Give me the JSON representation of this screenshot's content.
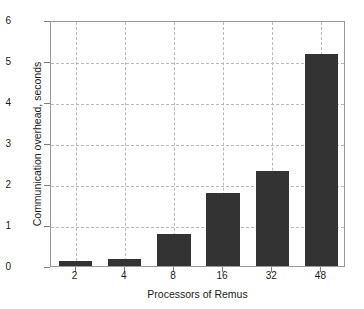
{
  "chart_data": {
    "type": "bar",
    "title": "",
    "xlabel": "Processors of Remus",
    "ylabel": "Communication overhead, seconds",
    "categories": [
      "2",
      "4",
      "8",
      "16",
      "32",
      "48"
    ],
    "values": [
      0.12,
      0.18,
      0.78,
      1.77,
      2.31,
      5.18
    ],
    "series": [
      {
        "name": "Communication overhead",
        "values": [
          0.12,
          0.18,
          0.78,
          1.77,
          2.31,
          5.18
        ]
      }
    ],
    "ylim": [
      0,
      6
    ],
    "yticks": [
      0,
      1,
      2,
      3,
      4,
      5,
      6
    ],
    "ytick_labels": [
      "0",
      "1",
      "2",
      "3",
      "4",
      "5",
      "6"
    ],
    "xtick_labels": [
      "2",
      "4",
      "8",
      "16",
      "32",
      "48"
    ],
    "grid": true,
    "grid_style": "dashed",
    "legend": null,
    "bar_color": "#333333",
    "grid_color": "#b9b9b9",
    "axis_color": "#9a9a9a",
    "background": "#ffffff"
  }
}
